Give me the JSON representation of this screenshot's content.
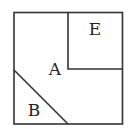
{
  "diagram": {
    "type": "geometric-square-partition",
    "labels": {
      "large_region": "A",
      "triangle": "B",
      "inner_square": "E"
    },
    "colors": {
      "stroke": "#333333",
      "background": "#ffffff"
    }
  }
}
